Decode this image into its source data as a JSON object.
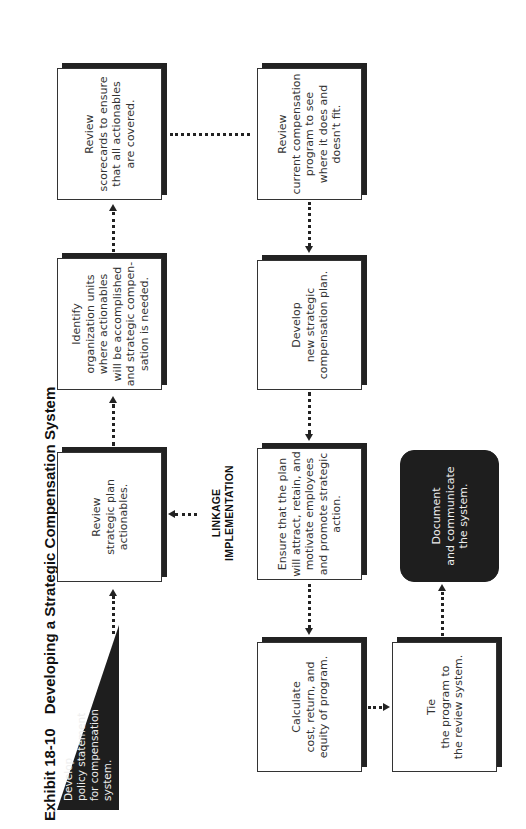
{
  "title": {
    "exhibit": "Exhibit 18-10",
    "text": "Developing a Strategic Compensation System"
  },
  "nodes": {
    "policy": {
      "lines": [
        "Develop",
        "policy statement",
        "for compensation",
        "system."
      ],
      "shape": "triangle",
      "fill": "#1e1e1e"
    },
    "review_plan": {
      "lines": [
        "Review",
        "strategic plan",
        "actionables."
      ]
    },
    "identify_units": {
      "lines": [
        "Identify",
        "organization units",
        "where actionables",
        "will be accomplished",
        "and strategic compen-",
        "sation is needed."
      ]
    },
    "review_scorecards": {
      "lines": [
        "Review",
        "scorecards to ensure",
        "that all actionables",
        "are covered."
      ]
    },
    "review_current": {
      "lines": [
        "Review",
        "current compensation",
        "program to see",
        "where it does and",
        "doesn't fit."
      ]
    },
    "develop_plan": {
      "lines": [
        "Develop",
        "new strategic",
        "compensation plan."
      ]
    },
    "ensure": {
      "lines": [
        "Ensure that the plan",
        "will attract, retain, and",
        "motivate employees",
        "and promote strategic",
        "action."
      ]
    },
    "calculate": {
      "lines": [
        "Calculate",
        "cost, return, and",
        "equity of program."
      ]
    },
    "tie": {
      "lines": [
        "Tie",
        "the program to",
        "the review system."
      ]
    },
    "document": {
      "lines": [
        "Document",
        "and communicate",
        "the system."
      ],
      "fill": "#1e1e1e"
    }
  },
  "annotation": {
    "line1": "LINKAGE",
    "line2": "IMPLEMENTATION"
  },
  "colors": {
    "dark_fill": "#1e1e1e",
    "border": "#333333",
    "background": "#ffffff"
  }
}
